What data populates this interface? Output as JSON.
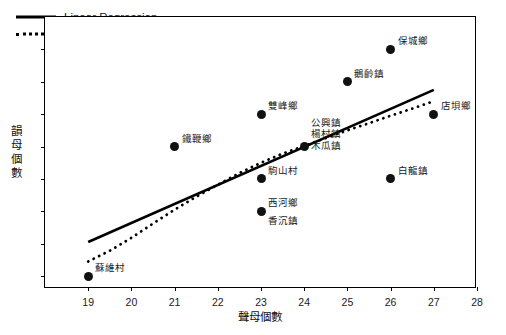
{
  "chart_data": {
    "type": "scatter",
    "title": "",
    "xlabel": "聲母個數",
    "ylabel": "韻母個數",
    "xlim": [
      18,
      28
    ],
    "ylim": [
      32.6,
      41
    ],
    "xticks": [
      19,
      20,
      21,
      22,
      23,
      24,
      25,
      26,
      27,
      28
    ],
    "yticks": [
      33,
      34,
      35,
      36,
      37,
      38,
      39,
      40,
      41
    ],
    "grid": false,
    "legend_position": "upper-left",
    "legend": [
      {
        "label": "Linear Regression",
        "style": "solid"
      },
      {
        "label": "Polynomial Regression",
        "style": "dotted"
      }
    ],
    "points": [
      {
        "x": 19,
        "y": 33,
        "labels": [
          "蘇維村"
        ],
        "label_pos": "right-above"
      },
      {
        "x": 21,
        "y": 37,
        "labels": [
          "鐵鞭鄉"
        ],
        "label_pos": "right-above"
      },
      {
        "x": 23,
        "y": 38,
        "labels": [
          "雙峰鄉"
        ],
        "label_pos": "right-above"
      },
      {
        "x": 23,
        "y": 36,
        "labels": [
          "駒山村"
        ],
        "label_pos": "right-above"
      },
      {
        "x": 23,
        "y": 35,
        "labels": [
          "西河鄉",
          "香沉鎮"
        ],
        "label_pos": "right-split"
      },
      {
        "x": 24,
        "y": 37,
        "labels": [
          "公興鎮",
          "楊村鎮",
          "木瓜鎮"
        ],
        "label_pos": "right-stack"
      },
      {
        "x": 25,
        "y": 39,
        "labels": [
          "鵝齡鎮"
        ],
        "label_pos": "right-above"
      },
      {
        "x": 26,
        "y": 40,
        "labels": [
          "保城鄉"
        ],
        "label_pos": "right-above"
      },
      {
        "x": 26,
        "y": 36,
        "labels": [
          "白龍鎮"
        ],
        "label_pos": "right-above"
      },
      {
        "x": 27,
        "y": 38,
        "labels": [
          "店垻鄉"
        ],
        "label_pos": "right-above"
      }
    ],
    "linear_regression": {
      "style": "solid",
      "x_start": 19,
      "y_start": 34.05,
      "x_end": 27,
      "y_end": 38.75
    },
    "polynomial_regression": {
      "style": "dotted",
      "points": [
        [
          19.0,
          33.45
        ],
        [
          19.5,
          33.78
        ],
        [
          20.0,
          34.18
        ],
        [
          20.5,
          34.62
        ],
        [
          21.0,
          35.05
        ],
        [
          21.5,
          35.45
        ],
        [
          22.0,
          35.82
        ],
        [
          22.5,
          36.18
        ],
        [
          23.0,
          36.5
        ],
        [
          23.5,
          36.78
        ],
        [
          24.0,
          37.02
        ],
        [
          24.5,
          37.26
        ],
        [
          25.0,
          37.5
        ],
        [
          25.5,
          37.72
        ],
        [
          26.0,
          37.95
        ],
        [
          26.5,
          38.17
        ],
        [
          27.0,
          38.4
        ]
      ]
    }
  }
}
